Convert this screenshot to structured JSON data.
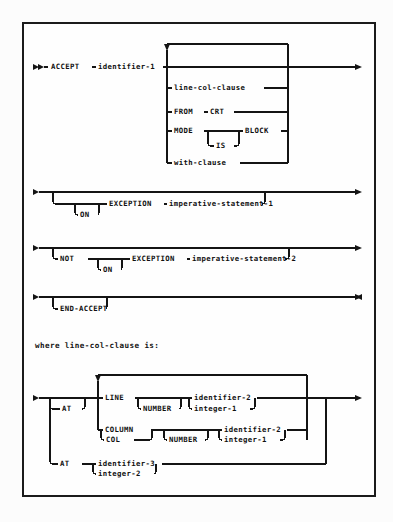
{
  "document": {
    "kind": "railroad-syntax-diagram",
    "language": "COBOL",
    "statement": "ACCEPT",
    "caption": "where line-col-clause is:",
    "colors": {
      "ink": "#141414",
      "paper": "#fefefe",
      "frame": "#1b1b1b"
    }
  },
  "diagram_main": {
    "name": "accept-statement",
    "terminals": {
      "accept": "ACCEPT",
      "from": "FROM",
      "crt": "CRT",
      "mode": "MODE",
      "is": "IS",
      "block": "BLOCK",
      "on": "ON",
      "not": "NOT",
      "exception": "EXCEPTION",
      "end_accept": "END-ACCEPT"
    },
    "nonterminals": {
      "identifier_1": "identifier-1",
      "line_col_clause": "line-col-clause",
      "with_clause": "with-clause",
      "imperative_statement_1": "imperative-statement-1",
      "imperative_statement_2": "imperative-statement-2"
    },
    "rows": {
      "r_main": "identifier-1",
      "r_line_col": "line-col-clause",
      "r_from_crt": "FROM CRT",
      "r_mode_block": "MODE IS BLOCK",
      "r_with": "with-clause",
      "r_exception_1": "ON EXCEPTION imperative-statement-1",
      "r_exception_2": "NOT ON EXCEPTION imperative-statement-2",
      "r_end": "END-ACCEPT"
    }
  },
  "diagram_line_col": {
    "name": "line-col-clause",
    "terminals": {
      "at_1": "AT",
      "line": "LINE",
      "number_1": "NUMBER",
      "column": "COLUMN",
      "col": "COL",
      "number_2": "NUMBER",
      "at_2": "AT"
    },
    "nonterminals": {
      "identifier_2a": "identifier-2",
      "integer_1a": "integer-1",
      "identifier_2b": "identifier-2",
      "integer_1b": "integer-1",
      "identifier_3": "identifier-3",
      "integer_2": "integer-2"
    }
  }
}
